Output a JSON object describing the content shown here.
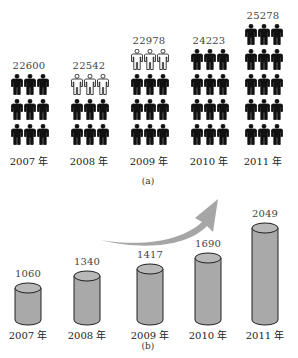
{
  "top_clipped_text": "",
  "figure_a": {
    "caption": "(a)",
    "columns": [
      {
        "year": "2007 年",
        "value": "22600",
        "rows": [
          "black",
          "black",
          "black"
        ]
      },
      {
        "year": "2008 年",
        "value": "22542",
        "rows": [
          "white",
          "black",
          "black"
        ]
      },
      {
        "year": "2009 年",
        "value": "22978",
        "rows": [
          "white",
          "black",
          "black",
          "black"
        ]
      },
      {
        "year": "2010 年",
        "value": "24223",
        "rows": [
          "black",
          "black",
          "black",
          "black"
        ]
      },
      {
        "year": "2011 年",
        "value": "25278",
        "rows": [
          "black",
          "black",
          "black",
          "black",
          "black"
        ]
      }
    ]
  },
  "figure_b": {
    "caption": "(b)",
    "columns": [
      {
        "year": "2007 年",
        "value": "1060"
      },
      {
        "year": "2008 年",
        "value": "1340"
      },
      {
        "year": "2009 年",
        "value": "1417"
      },
      {
        "year": "2010 年",
        "value": "1690"
      },
      {
        "year": "2011 年",
        "value": "2049"
      }
    ],
    "arrow": "upward-trend-arrow"
  },
  "colors": {
    "person_black": "#111111",
    "person_white": "#ffffff",
    "cylinder_fill": "#a9a9a9",
    "cylinder_top": "#b8b8b8",
    "cylinder_stroke": "#222222",
    "arrow_fill": "#a6a6a6"
  },
  "chart_data": [
    {
      "type": "bar",
      "title": "(a)",
      "style": "pictogram",
      "categories": [
        "2007 年",
        "2008 年",
        "2009 年",
        "2010 年",
        "2011 年"
      ],
      "values": [
        22600,
        22542,
        22978,
        24223,
        25278
      ],
      "icon_rows": [
        3,
        3,
        4,
        4,
        5
      ],
      "xlabel": "",
      "ylabel": "",
      "grid": false
    },
    {
      "type": "bar",
      "title": "(b)",
      "style": "cylinder",
      "categories": [
        "2007 年",
        "2008 年",
        "2009 年",
        "2010 年",
        "2011 年"
      ],
      "values": [
        1060,
        1340,
        1417,
        1690,
        2049
      ],
      "annotations": [
        "upward curved arrow indicating growth"
      ],
      "xlabel": "",
      "ylabel": "",
      "grid": false
    }
  ]
}
